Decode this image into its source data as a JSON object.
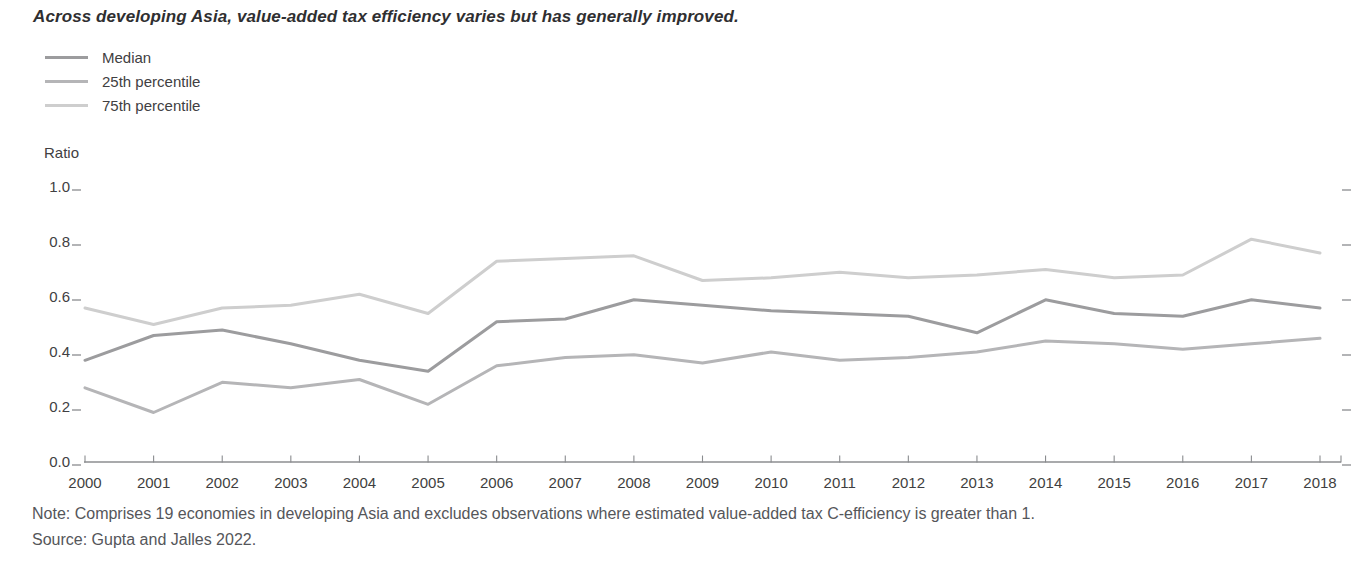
{
  "title": "Across developing Asia, value-added tax efficiency varies but has generally improved.",
  "note": "Note: Comprises 19 economies in developing Asia and excludes observations where estimated value-added tax C-efficiency is greater than 1.",
  "source": "Source: Gupta and Jalles 2022.",
  "colors": {
    "median_line": "#9c9c9e",
    "p25_line": "#b5b5b7",
    "p75_line": "#cecece",
    "axis": "#55565a",
    "text": "#414042"
  },
  "chart_data": {
    "type": "line",
    "title": "Across developing Asia, value-added tax efficiency varies but has generally improved.",
    "xlabel": "",
    "ylabel": "Ratio",
    "ylim": [
      0.0,
      1.0
    ],
    "yticks": [
      0.0,
      0.2,
      0.4,
      0.6,
      0.8,
      1.0
    ],
    "grid": false,
    "legend_position": "top-left",
    "x": [
      2000,
      2001,
      2002,
      2003,
      2004,
      2005,
      2006,
      2007,
      2008,
      2009,
      2010,
      2011,
      2012,
      2013,
      2014,
      2015,
      2016,
      2017,
      2018
    ],
    "series": [
      {
        "name": "Median",
        "color": "#9c9c9e",
        "values": [
          0.37,
          0.46,
          0.48,
          0.43,
          0.37,
          0.33,
          0.51,
          0.52,
          0.59,
          0.57,
          0.55,
          0.54,
          0.53,
          0.47,
          0.59,
          0.54,
          0.53,
          0.59,
          0.56
        ]
      },
      {
        "name": "25th percentile",
        "color": "#b5b5b7",
        "values": [
          0.27,
          0.18,
          0.29,
          0.27,
          0.3,
          0.21,
          0.35,
          0.38,
          0.39,
          0.36,
          0.4,
          0.37,
          0.38,
          0.4,
          0.44,
          0.43,
          0.41,
          0.43,
          0.45
        ]
      },
      {
        "name": "75th percentile",
        "color": "#cecece",
        "values": [
          0.56,
          0.5,
          0.56,
          0.57,
          0.61,
          0.54,
          0.73,
          0.74,
          0.75,
          0.66,
          0.67,
          0.69,
          0.67,
          0.68,
          0.7,
          0.67,
          0.68,
          0.81,
          0.76
        ]
      }
    ]
  }
}
